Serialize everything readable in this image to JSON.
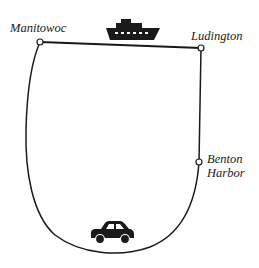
{
  "diagram": {
    "title": "",
    "colors": {
      "line": "#1a1a1a",
      "background": "#ffffff"
    },
    "nodes": [
      {
        "id": "manitowoc",
        "label": "Manitowoc",
        "x": 40,
        "y": 42
      },
      {
        "id": "ludington",
        "label": "Ludington",
        "x": 201,
        "y": 48
      },
      {
        "id": "benton_harbor",
        "label_line1": "Benton",
        "label_line2": "Harbor",
        "x": 199,
        "y": 162
      }
    ],
    "edges": [
      {
        "from": "manitowoc",
        "to": "ludington",
        "mode": "ferry",
        "icon": "ship-icon"
      },
      {
        "from": "ludington",
        "to": "benton_harbor",
        "mode": "road",
        "style": "straight"
      },
      {
        "from": "benton_harbor",
        "to": "manitowoc",
        "mode": "car",
        "icon": "car-icon",
        "style": "curved"
      }
    ],
    "icons": {
      "ship": "ship-icon",
      "car": "car-icon"
    }
  }
}
